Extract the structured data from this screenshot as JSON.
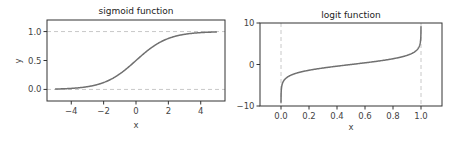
{
  "chart_data": [
    {
      "type": "line",
      "title": "sigmoid function",
      "xlabel": "x",
      "ylabel": "y",
      "xlim": [
        -5.5,
        5.5
      ],
      "ylim": [
        -0.2,
        1.2
      ],
      "xticks": [
        -4,
        -2,
        0,
        2,
        4
      ],
      "xtick_labels": [
        "−4",
        "−2",
        "0",
        "2",
        "4"
      ],
      "yticks": [
        0.0,
        0.5,
        1.0
      ],
      "ytick_labels": [
        "0.0",
        "0.5",
        "1.0"
      ],
      "grid": false,
      "reference_lines": [
        {
          "orientation": "horizontal",
          "value": 0.0,
          "style": "dashed"
        },
        {
          "orientation": "horizontal",
          "value": 1.0,
          "style": "dashed"
        }
      ],
      "series": [
        {
          "name": "sigmoid",
          "function": "1/(1+exp(-x))",
          "x": [
            -5,
            -4,
            -3,
            -2,
            -1,
            0,
            1,
            2,
            3,
            4,
            5
          ],
          "y": [
            0.007,
            0.018,
            0.047,
            0.119,
            0.269,
            0.5,
            0.731,
            0.881,
            0.953,
            0.982,
            0.993
          ]
        }
      ]
    },
    {
      "type": "line",
      "title": "logit function",
      "xlabel": "x",
      "ylabel": "",
      "xlim": [
        -0.15,
        1.15
      ],
      "ylim": [
        -10,
        10
      ],
      "xticks": [
        0.0,
        0.2,
        0.4,
        0.6,
        0.8,
        1.0
      ],
      "xtick_labels": [
        "0.0",
        "0.2",
        "0.4",
        "0.6",
        "0.8",
        "1.0"
      ],
      "yticks": [
        -10,
        0,
        10
      ],
      "ytick_labels": [
        "−10",
        "0",
        "10"
      ],
      "grid": false,
      "reference_lines": [
        {
          "orientation": "vertical",
          "value": 0.0,
          "style": "dashed"
        },
        {
          "orientation": "vertical",
          "value": 1.0,
          "style": "dashed"
        }
      ],
      "series": [
        {
          "name": "logit",
          "function": "log(x/(1-x))",
          "x": [
            0.0001,
            0.01,
            0.05,
            0.1,
            0.2,
            0.3,
            0.4,
            0.5,
            0.6,
            0.7,
            0.8,
            0.9,
            0.95,
            0.99,
            0.9999
          ],
          "y": [
            -9.21,
            -4.6,
            -2.94,
            -2.2,
            -1.39,
            -0.85,
            -0.41,
            0.0,
            0.41,
            0.85,
            1.39,
            2.2,
            2.94,
            4.6,
            9.21
          ]
        }
      ]
    }
  ],
  "panels": {
    "left": {
      "title": "sigmoid function",
      "xlabel": "x",
      "ylabel": "y"
    },
    "right": {
      "title": "logit function",
      "xlabel": "x"
    }
  },
  "colors": {
    "curve": "#707070",
    "frame": "#333333",
    "reference": "#c8c8c8"
  }
}
